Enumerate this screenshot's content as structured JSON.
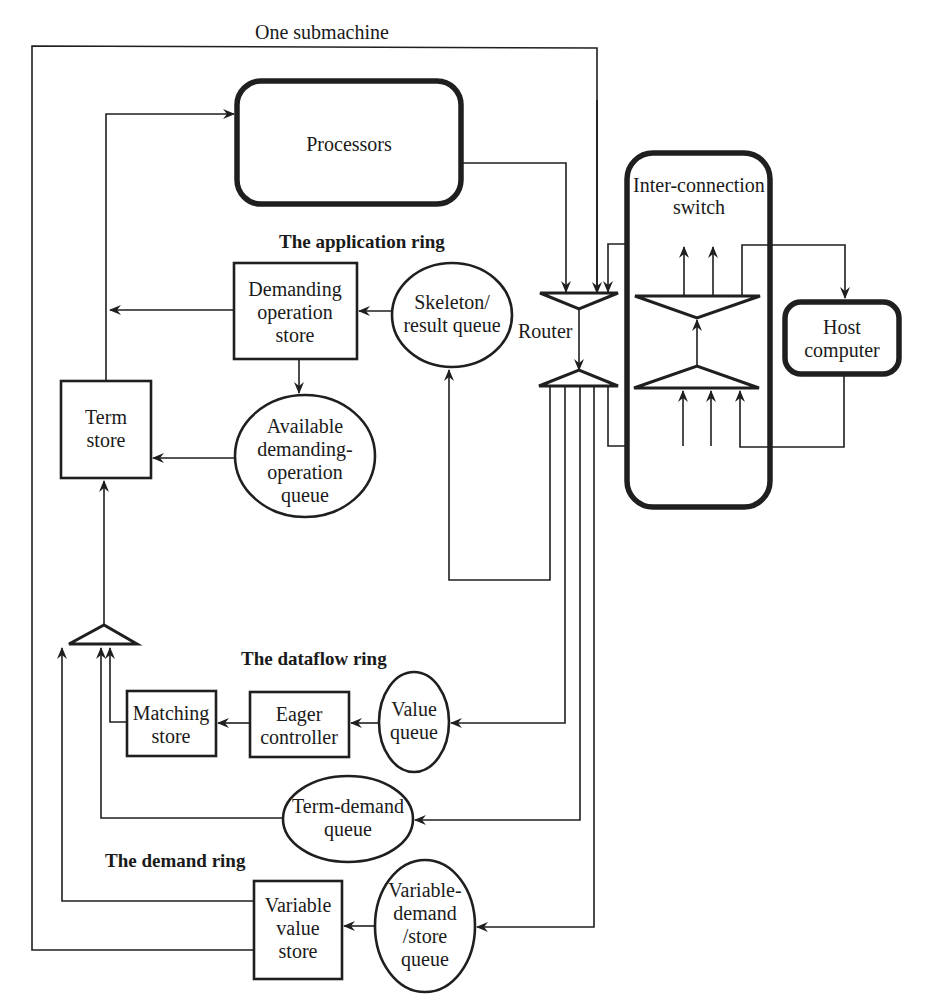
{
  "diagram": {
    "title": "One submachine",
    "rings": {
      "application": "The application ring",
      "dataflow": "The dataflow ring",
      "demand": "The demand ring"
    },
    "nodes": {
      "processors": [
        "Processors"
      ],
      "interconnect": [
        "Inter-connection",
        "switch"
      ],
      "host": [
        "Host",
        "computer"
      ],
      "router": [
        "Router"
      ],
      "demanding_store": [
        "Demanding",
        "operation",
        "store"
      ],
      "skeleton_queue": [
        "Skeleton/",
        "result queue"
      ],
      "term_store": [
        "Term",
        "store"
      ],
      "available_queue": [
        "Available",
        "demanding-",
        "operation",
        "queue"
      ],
      "matching_store": [
        "Matching",
        "store"
      ],
      "eager_controller": [
        "Eager",
        "controller"
      ],
      "value_queue": [
        "Value",
        "queue"
      ],
      "term_demand_queue": [
        "Term-demand",
        "queue"
      ],
      "variable_value_store": [
        "Variable",
        "value",
        "store"
      ],
      "variable_demand_queue": [
        "Variable-",
        "demand",
        "/store",
        "queue"
      ]
    },
    "colors": {
      "stroke": "#1f1f1f",
      "background": "#ffffff"
    }
  }
}
